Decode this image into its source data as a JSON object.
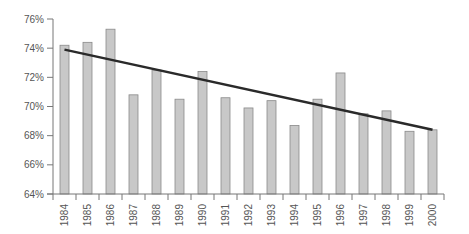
{
  "chart_data": {
    "type": "bar",
    "title": "",
    "xlabel": "",
    "ylabel": "",
    "categories": [
      "1984",
      "1985",
      "1986",
      "1987",
      "1988",
      "1989",
      "1990",
      "1991",
      "1992",
      "1993",
      "1994",
      "1995",
      "1996",
      "1997",
      "1998",
      "1999",
      "2000"
    ],
    "values": [
      74.2,
      74.4,
      75.3,
      70.8,
      72.5,
      70.5,
      72.4,
      70.6,
      69.9,
      70.4,
      68.7,
      70.5,
      72.3,
      69.5,
      69.7,
      68.3,
      68.4
    ],
    "trend_line": {
      "start": 73.9,
      "end": 68.4,
      "from": "1984",
      "to": "2000"
    },
    "ylim": [
      64,
      76
    ],
    "y_ticks": [
      64,
      66,
      68,
      70,
      72,
      74,
      76
    ],
    "y_tick_labels": [
      "64%",
      "66%",
      "68%",
      "70%",
      "72%",
      "74%",
      "76%"
    ],
    "grid": false,
    "legend": null,
    "colors": {
      "bar_fill": "#c8c8c8",
      "bar_stroke": "#8a8a8a",
      "trend": "#2a2a2a",
      "axis": "#777777"
    }
  }
}
